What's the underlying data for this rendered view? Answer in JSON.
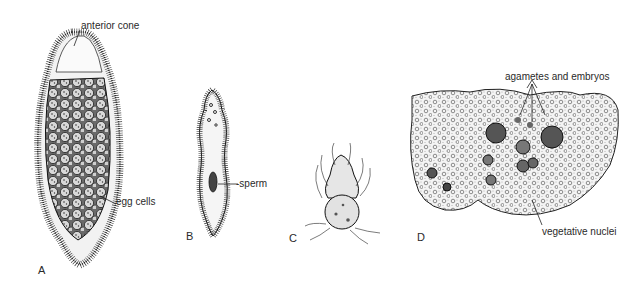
{
  "figure": {
    "panels": [
      {
        "id": "A",
        "letter": "A",
        "labels": [
          "anterior cone",
          "egg cells"
        ]
      },
      {
        "id": "B",
        "letter": "B",
        "labels": [
          "sperm"
        ]
      },
      {
        "id": "C",
        "letter": "C",
        "labels": []
      },
      {
        "id": "D",
        "letter": "D",
        "labels": [
          "agametes and embryos",
          "vegetative nuclei"
        ]
      }
    ]
  },
  "labels": {
    "anterior_cone": "anterior cone",
    "egg_cells": "egg cells",
    "sperm": "-sperm",
    "agametes_embryos": "agametes and embryos",
    "vegetative_nuclei": "vegetative nuclei"
  },
  "letters": {
    "a": "A",
    "b": "B",
    "c": "C",
    "d": "D"
  },
  "colors": {
    "ink": "#2a2a2a",
    "background": "#ffffff",
    "cell_fill": "#e8e8e8",
    "dark_embryo": "#555555"
  }
}
